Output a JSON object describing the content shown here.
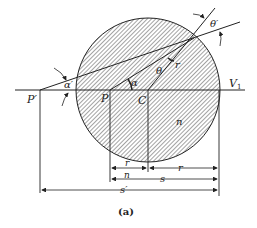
{
  "figure": {
    "caption": "(a)",
    "labels": {
      "p_prime": "P′",
      "p": "P",
      "c": "C",
      "v1": "V",
      "v1_sub": "1",
      "alpha_prime": "α′",
      "alpha": "α",
      "theta": "θ",
      "theta_prime": "θ′",
      "r_radius": "r",
      "n_medium": "n",
      "dim_r_over_n_num": "r",
      "dim_r_over_n_den": "n",
      "dim_r": "r",
      "dim_s": "s",
      "dim_s_prime": "s′"
    },
    "colors": {
      "ink": "#222222",
      "hatch": "#555555",
      "background": "#ffffff"
    }
  }
}
